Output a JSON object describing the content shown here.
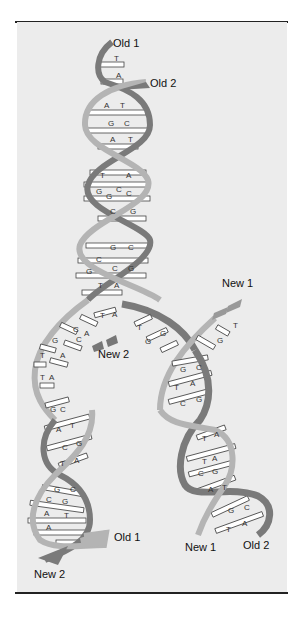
{
  "figure": {
    "labels": {
      "old1_top": "Old 1",
      "old2_top": "Old 2",
      "new1_fork": "New 1",
      "new2_fork": "New 2",
      "old1_bottom": "Old 1",
      "new2_bottom": "New 2",
      "new1_bottom": "New 1",
      "old2_bottom": "Old 2"
    },
    "colors": {
      "background": "#ececec",
      "old_strand_dark": "#7a7a7a",
      "new_strand_light": "#b4b4b4",
      "base_pair_fill": "#ffffff",
      "rule": "#222222"
    },
    "parent_helix_pairs": [
      [
        "T",
        ""
      ],
      [
        "",
        "A"
      ],
      [
        "A",
        "T"
      ],
      [
        "G",
        "C"
      ],
      [
        "A",
        "T"
      ],
      [
        "T",
        "A"
      ],
      [
        "G",
        "C"
      ],
      [
        "G",
        "C"
      ],
      [
        "C",
        "G"
      ],
      [
        "G",
        "C"
      ],
      [
        "C",
        "G"
      ],
      [
        "G",
        "C"
      ],
      [
        "T",
        "A"
      ]
    ],
    "fork_unpaired_left": [
      "T",
      "A",
      "C",
      "A",
      "G",
      "C",
      "T",
      "A",
      "T",
      "A"
    ],
    "fork_unpaired_right": [
      "T",
      "G",
      "G",
      "T",
      "G"
    ],
    "left_daughter_pairs": [
      [
        "G",
        "C"
      ],
      [
        "A",
        "T"
      ],
      [
        "C",
        "G"
      ],
      [
        "T",
        "A"
      ],
      [
        "G",
        "C"
      ],
      [
        "C",
        "G"
      ],
      [
        "A",
        "T"
      ],
      [
        "A",
        "T"
      ]
    ],
    "right_daughter_pairs": [
      [
        "G",
        "C"
      ],
      [
        "T",
        "A"
      ],
      [
        "C",
        "G"
      ],
      [
        "T",
        "A"
      ],
      [
        "T",
        "A"
      ],
      [
        "C",
        "G"
      ],
      [
        "A",
        "T"
      ],
      [
        "G",
        "C"
      ],
      [
        "T",
        "A"
      ]
    ]
  }
}
